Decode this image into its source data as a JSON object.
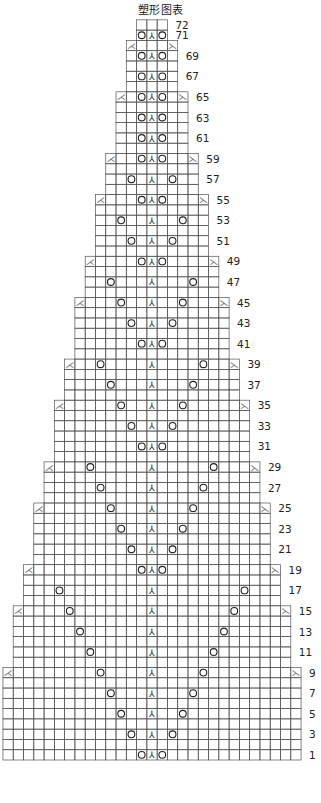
{
  "title": "塑形图表",
  "footer": "",
  "colors": {
    "line": "#555555",
    "symbol": "#222222",
    "dec": "#777777",
    "label": "#222222"
  },
  "chart_data": {
    "type": "knitting-chart",
    "title": "塑形图表",
    "total_rows": 72,
    "row_labels": [
      1,
      3,
      5,
      7,
      9,
      11,
      13,
      15,
      17,
      19,
      21,
      23,
      25,
      27,
      29,
      31,
      33,
      35,
      37,
      39,
      41,
      43,
      45,
      47,
      49,
      51,
      53,
      55,
      57,
      59,
      61,
      63,
      65,
      67,
      69,
      71,
      72
    ],
    "legend_symbols": {
      "yo": "O",
      "center_double_decrease": "⅄",
      "left_decrease": "⅃ (k2tog-left)",
      "right_decrease": "⅄ (ssk-right)"
    },
    "tiers": [
      {
        "from": 1,
        "to": 9,
        "half_width": 14,
        "dec_row": 9
      },
      {
        "from": 10,
        "to": 15,
        "half_width": 13,
        "dec_row": 15
      },
      {
        "from": 16,
        "to": 19,
        "half_width": 12,
        "dec_row": 19
      },
      {
        "from": 20,
        "to": 25,
        "half_width": 11,
        "dec_row": 25
      },
      {
        "from": 26,
        "to": 29,
        "half_width": 10,
        "dec_row": 29
      },
      {
        "from": 30,
        "to": 35,
        "half_width": 9,
        "dec_row": 35
      },
      {
        "from": 36,
        "to": 39,
        "half_width": 8,
        "dec_row": 39
      },
      {
        "from": 40,
        "to": 45,
        "half_width": 7,
        "dec_row": 45
      },
      {
        "from": 46,
        "to": 49,
        "half_width": 6,
        "dec_row": 49
      },
      {
        "from": 50,
        "to": 55,
        "half_width": 5,
        "dec_row": 55
      },
      {
        "from": 56,
        "to": 59,
        "half_width": 4,
        "dec_row": 59
      },
      {
        "from": 60,
        "to": 65,
        "half_width": 3,
        "dec_row": 65
      },
      {
        "from": 66,
        "to": 70,
        "half_width": 2,
        "dec_row": 70
      },
      {
        "from": 71,
        "to": 72,
        "half_width": 1,
        "dec_row": null
      }
    ],
    "yo_offsets": {
      "1": 1,
      "3": 2,
      "5": 3,
      "7": 4,
      "9": 5,
      "11": 6,
      "13": 7,
      "15": 8,
      "17": 9,
      "19": 1,
      "21": 2,
      "23": 3,
      "25": 4,
      "27": 5,
      "29": 6,
      "31": 1,
      "33": 2,
      "35": 3,
      "37": 4,
      "39": 5,
      "41": 1,
      "43": 2,
      "45": 3,
      "47": 4,
      "49": 1,
      "51": 2,
      "53": 3,
      "55": 1,
      "57": 2,
      "59": 1,
      "61": 1,
      "63": 1,
      "65": 1,
      "67": 1,
      "69": 1,
      "71": 1
    },
    "center_stitch_rows": "odd rows 1–71"
  }
}
